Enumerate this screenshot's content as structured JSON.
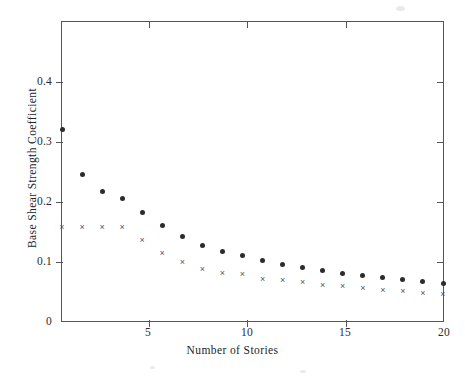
{
  "figure": {
    "background_color": "#ffffff",
    "axis_color": "#55555a"
  },
  "axes": {
    "x_title": "Number of Stories",
    "y_title": "Base Shear Strength Coefficient",
    "x_ticks": [
      "5",
      "10",
      "15",
      "20"
    ],
    "x_tick_values": [
      5,
      10,
      15,
      20
    ],
    "y_ticks": [
      "0",
      "0.1",
      "0.2",
      "0.3",
      "0.4"
    ],
    "y_tick_values": [
      0,
      0.1,
      0.2,
      0.3,
      0.4
    ],
    "x_range": [
      1,
      20
    ],
    "y_range": [
      0,
      0.5
    ]
  },
  "chart_data": {
    "type": "scatter",
    "title": "",
    "xlabel": "Number of Stories",
    "ylabel": "Base Shear Strength Coefficient",
    "xlim": [
      1,
      20
    ],
    "ylim": [
      0,
      0.5
    ],
    "xticks": [
      5,
      10,
      15,
      20
    ],
    "yticks": [
      0,
      0.1,
      0.2,
      0.3,
      0.4
    ],
    "grid": false,
    "legend": "none",
    "x": [
      1,
      2,
      3,
      4,
      5,
      6,
      7,
      8,
      9,
      10,
      11,
      12,
      13,
      14,
      15,
      16,
      17,
      18,
      19,
      20
    ],
    "series": [
      {
        "name": "filled-circle-series",
        "marker": "circle",
        "color": "#2b2b30",
        "values": [
          0.32,
          0.245,
          0.217,
          0.205,
          0.181,
          0.159,
          0.142,
          0.126,
          0.116,
          0.109,
          0.101,
          0.094,
          0.089,
          0.085,
          0.079,
          0.076,
          0.073,
          0.069,
          0.066,
          0.063
        ]
      },
      {
        "name": "cross-series",
        "marker": "x",
        "color": "#56565c",
        "values": [
          0.156,
          0.156,
          0.156,
          0.156,
          0.134,
          0.113,
          0.098,
          0.086,
          0.08,
          0.077,
          0.07,
          0.067,
          0.064,
          0.06,
          0.057,
          0.054,
          0.051,
          0.049,
          0.046,
          0.044
        ]
      }
    ]
  }
}
